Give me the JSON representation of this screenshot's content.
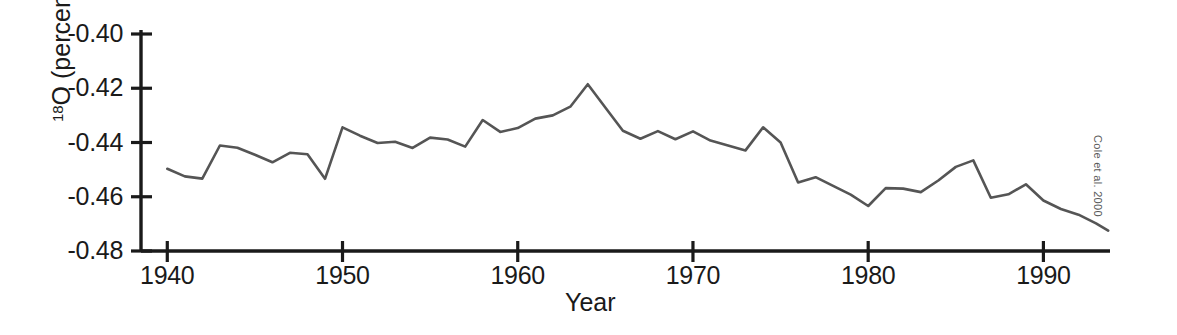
{
  "chart_data": {
    "type": "line",
    "title": "",
    "xlabel": "Year",
    "ylabel": "18O (percent)",
    "ylabel_base": "O (percent)",
    "ylabel_superscript": "18",
    "xlim": [
      1938.5,
      1993.8
    ],
    "ylim": [
      -0.48,
      -0.4
    ],
    "grid": false,
    "legend": null,
    "annotation": "Cole et al. 2000",
    "line_color": "#555555",
    "axis_color": "#1a1a1a",
    "xticks": [
      1940,
      1950,
      1960,
      1970,
      1980,
      1990
    ],
    "xtick_labels": [
      "1940",
      "1950",
      "1960",
      "1970",
      "1980",
      "1990"
    ],
    "yticks": [
      -0.4,
      -0.42,
      -0.44,
      -0.46,
      -0.48
    ],
    "ytick_labels": [
      "-0.40",
      "-0.42",
      "-0.44",
      "-0.46",
      "-0.48"
    ],
    "series": [
      {
        "name": "d18O",
        "x": [
          1940,
          1941,
          1942,
          1943,
          1944,
          1945,
          1946,
          1947,
          1948,
          1949,
          1950,
          1951,
          1952,
          1953,
          1954,
          1955,
          1956,
          1957,
          1958,
          1959,
          1960,
          1961,
          1962,
          1963,
          1964,
          1965,
          1966,
          1967,
          1968,
          1969,
          1970,
          1971,
          1972,
          1973,
          1974,
          1975,
          1976,
          1977,
          1978,
          1979,
          1980,
          1981,
          1982,
          1983,
          1984,
          1985,
          1986,
          1987,
          1988,
          1989,
          1990,
          1991,
          1992,
          1993,
          1993.7
        ],
        "values": [
          -0.4497,
          -0.4525,
          -0.4533,
          -0.4411,
          -0.4419,
          -0.4445,
          -0.4473,
          -0.4438,
          -0.4443,
          -0.4534,
          -0.4344,
          -0.4375,
          -0.4402,
          -0.4397,
          -0.442,
          -0.4382,
          -0.4389,
          -0.4415,
          -0.4317,
          -0.4361,
          -0.4347,
          -0.4312,
          -0.43,
          -0.4268,
          -0.4185,
          -0.4271,
          -0.4357,
          -0.4386,
          -0.4358,
          -0.4388,
          -0.4359,
          -0.4393,
          -0.4411,
          -0.4429,
          -0.4344,
          -0.44,
          -0.4547,
          -0.4528,
          -0.456,
          -0.4592,
          -0.4634,
          -0.4568,
          -0.457,
          -0.4583,
          -0.454,
          -0.449,
          -0.4466,
          -0.4604,
          -0.4591,
          -0.4554,
          -0.4614,
          -0.4645,
          -0.4666,
          -0.4698,
          -0.4725
        ]
      }
    ]
  },
  "axes": {
    "x_axis_label": "Year",
    "y_axis_label": "18O (percent)"
  },
  "credit": {
    "text": "Cole et al. 2000"
  }
}
